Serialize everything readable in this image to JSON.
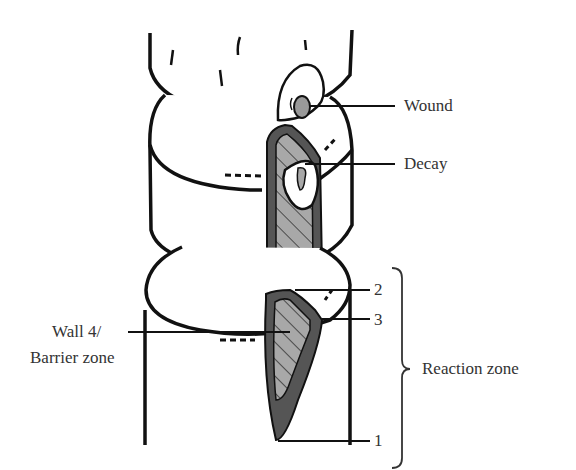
{
  "diagram": {
    "type": "tree-compartmentalization (CODIT) diagram",
    "labels": {
      "wound": "Wound",
      "decay": "Decay",
      "wall4_line1": "Wall 4/",
      "wall4_line2": "Barrier zone",
      "reaction_zone": "Reaction zone",
      "wall2": "2",
      "wall3": "3",
      "wall1": "1"
    },
    "colors": {
      "outline": "#111111",
      "reaction_zone_fill": "#555555",
      "decay_fill": "#a8a8a8",
      "wound_fill": "#999999",
      "text": "#333333",
      "background": "#ffffff"
    }
  }
}
